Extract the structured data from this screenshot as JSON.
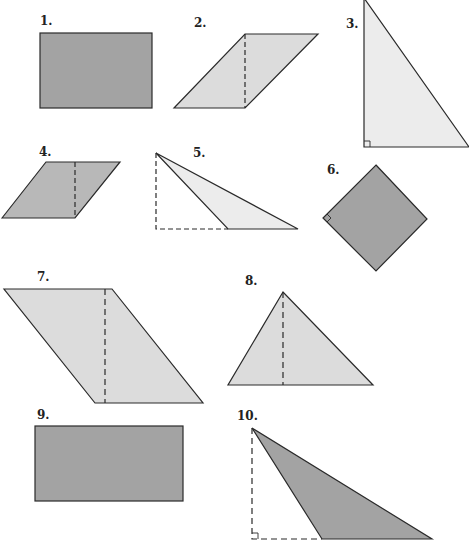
{
  "worksheet": {
    "colors": {
      "dark_fill": "#a3a3a3",
      "medium_fill": "#b8b8b8",
      "light_fill": "#dcdcdc",
      "very_light_fill": "#ececec",
      "stroke": "#2a2a2a"
    },
    "figures": [
      {
        "number": "1.",
        "shape": "rectangle",
        "fill": "dark",
        "dashed_height": false
      },
      {
        "number": "2.",
        "shape": "parallelogram",
        "fill": "light",
        "dashed_height": true
      },
      {
        "number": "3.",
        "shape": "right-triangle",
        "fill": "very_light",
        "right_angle_mark": true
      },
      {
        "number": "4.",
        "shape": "parallelogram",
        "fill": "medium",
        "dashed_height": true
      },
      {
        "number": "5.",
        "shape": "obtuse-triangle",
        "fill": "very_light",
        "dashed_height": true,
        "right_angle_mark": false
      },
      {
        "number": "6.",
        "shape": "square",
        "fill": "dark",
        "right_angle_mark": true
      },
      {
        "number": "7.",
        "shape": "parallelogram",
        "fill": "light",
        "dashed_height": true
      },
      {
        "number": "8.",
        "shape": "triangle",
        "fill": "light",
        "dashed_height": true
      },
      {
        "number": "9.",
        "shape": "rectangle",
        "fill": "dark",
        "dashed_height": false
      },
      {
        "number": "10.",
        "shape": "obtuse-triangle",
        "fill": "dark",
        "dashed_height": true,
        "right_angle_mark": true
      }
    ]
  }
}
